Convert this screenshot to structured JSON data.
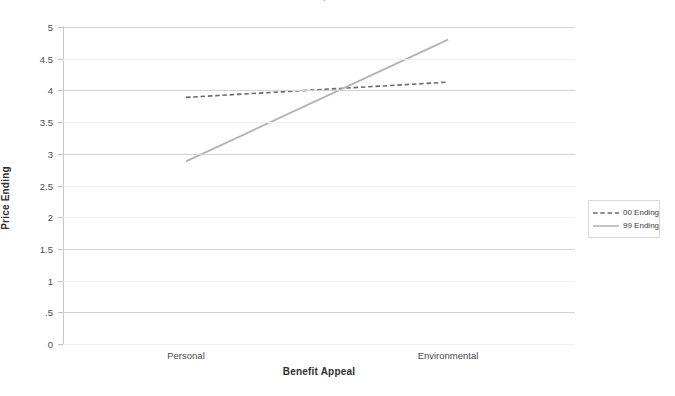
{
  "chart_data": {
    "type": "line",
    "title": "Study 2 Results",
    "xlabel": "Benefit Appeal",
    "ylabel": "Price Ending",
    "categories": [
      "Personal",
      "Environmental"
    ],
    "series": [
      {
        "name": "00 Ending",
        "values": [
          3.89,
          4.13
        ],
        "style": "dashed",
        "color": "#6b6b6b"
      },
      {
        "name": "99 Ending",
        "values": [
          2.88,
          4.8
        ],
        "style": "solid",
        "color": "#b3b3b3"
      }
    ],
    "ylim": [
      0,
      5
    ],
    "yticks": [
      0,
      0.5,
      1,
      1.5,
      2,
      2.5,
      3,
      3.5,
      4,
      4.5,
      5
    ],
    "ytick_labels": [
      "0",
      ".5",
      "1",
      "1.5",
      "2",
      "2.5",
      "3",
      "3.5",
      "4",
      "4.5",
      "5"
    ],
    "grid": true,
    "legend_position": "right"
  },
  "legend": {
    "entries": [
      {
        "label": "00 Ending"
      },
      {
        "label": "99 Ending"
      }
    ]
  },
  "axes": {
    "x_title": "Benefit Appeal",
    "y_title": "Price Ending",
    "x_categories": [
      "Personal",
      "Environmental"
    ],
    "y_tick_labels": [
      "5",
      "4.5",
      "4",
      "3.5",
      "3",
      "2.5",
      "2",
      "1.5",
      "1",
      ".5",
      "0"
    ]
  },
  "colors": {
    "series_00": "#6b6b6b",
    "series_99": "#b3b3b3",
    "grid_major": "#d2d2d6",
    "grid_minor": "#f0f0f3",
    "axis": "#c6c6cb",
    "text": "#3b3b3b"
  }
}
